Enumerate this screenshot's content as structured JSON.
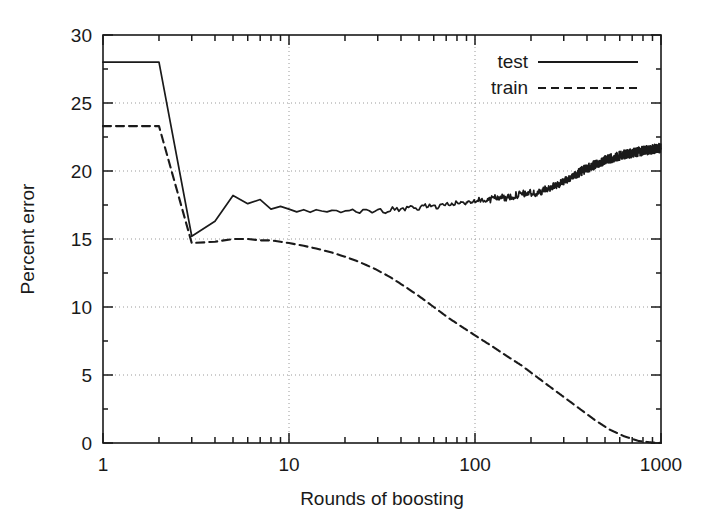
{
  "chart_data": {
    "type": "line",
    "title": "",
    "xlabel": "Rounds of boosting",
    "ylabel": "Percent error",
    "xscale": "log",
    "yscale": "linear",
    "xlim": [
      1,
      1000
    ],
    "ylim": [
      0,
      30
    ],
    "xticks": [
      1,
      10,
      100,
      1000
    ],
    "xtick_labels": [
      "1",
      "10",
      "100",
      "1000"
    ],
    "yticks": [
      0,
      5,
      10,
      15,
      20,
      25,
      30
    ],
    "ytick_labels": [
      "0",
      "5",
      "10",
      "15",
      "20",
      "25",
      "30"
    ],
    "grid": true,
    "grid_style": "dotted",
    "legend_position": "top-right",
    "series": [
      {
        "name": "test",
        "style": "solid",
        "color": "#1a1a1a",
        "x": [
          1,
          2,
          3,
          4,
          5,
          6,
          7,
          8,
          9,
          10,
          11,
          12,
          13,
          14,
          15,
          16,
          17,
          18,
          19,
          20,
          22,
          24,
          26,
          28,
          30,
          33,
          36,
          40,
          44,
          48,
          52,
          57,
          62,
          68,
          74,
          81,
          88,
          96,
          105,
          115,
          125,
          137,
          150,
          164,
          179,
          196,
          214,
          234,
          256,
          280,
          306,
          334,
          365,
          399,
          437,
          478,
          523,
          572,
          626,
          685,
          750,
          820,
          897,
          950,
          1000
        ],
        "y": [
          28.0,
          28.0,
          15.2,
          16.3,
          18.2,
          17.6,
          17.9,
          17.2,
          17.4,
          17.1,
          17.0,
          17.1,
          17.0,
          17.2,
          17.0,
          16.9,
          17.1,
          17.0,
          16.9,
          17.0,
          17.1,
          17.0,
          17.2,
          17.0,
          17.1,
          17.0,
          17.2,
          17.1,
          17.3,
          17.2,
          17.4,
          17.5,
          17.3,
          17.6,
          17.5,
          17.7,
          17.6,
          17.8,
          17.9,
          17.8,
          18.0,
          18.1,
          18.0,
          18.2,
          18.3,
          18.4,
          18.3,
          18.6,
          18.8,
          19.0,
          19.3,
          19.6,
          19.9,
          20.2,
          20.4,
          20.7,
          20.9,
          21.0,
          21.2,
          21.3,
          21.4,
          21.5,
          21.6,
          21.65,
          21.7
        ]
      },
      {
        "name": "train",
        "style": "dashed",
        "color": "#1a1a1a",
        "x": [
          1,
          2,
          3,
          4,
          5,
          6,
          7,
          8,
          9,
          10,
          12,
          14,
          17,
          20,
          24,
          29,
          35,
          42,
          50,
          60,
          72,
          86,
          103,
          124,
          148,
          178,
          213,
          255,
          306,
          367,
          440,
          527,
          632,
          757,
          870,
          1000
        ],
        "y": [
          23.3,
          23.3,
          14.7,
          14.8,
          15.0,
          15.0,
          14.9,
          14.9,
          14.8,
          14.7,
          14.5,
          14.3,
          14.0,
          13.7,
          13.3,
          12.8,
          12.2,
          11.5,
          10.8,
          10.0,
          9.2,
          8.5,
          7.8,
          7.1,
          6.4,
          5.7,
          4.9,
          4.1,
          3.3,
          2.5,
          1.7,
          1.0,
          0.5,
          0.15,
          0.05,
          0.0
        ]
      }
    ],
    "legend": [
      {
        "label": "test",
        "style": "solid"
      },
      {
        "label": "train",
        "style": "dashed"
      }
    ]
  }
}
